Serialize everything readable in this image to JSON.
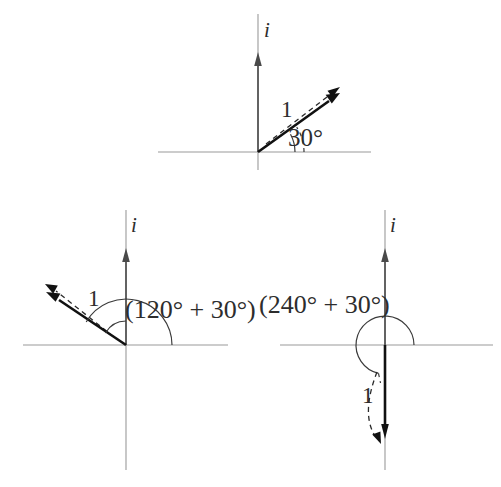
{
  "figure": {
    "background_color": "#ffffff",
    "axis_color": "#9a9a9a",
    "vector_color": "#111111",
    "label_color": "#2d2d2d",
    "panels": [
      {
        "id": "panel-top",
        "imaginary_axis_label": "i",
        "magnitude_label": "1",
        "angle_label": "30°",
        "angle_degrees": 30,
        "origin": [
          258,
          152
        ],
        "x_axis_span": [
          158,
          371
        ],
        "y_axis_span": [
          152,
          14
        ],
        "vector_tip": [
          334,
          98
        ],
        "dashed_arrow_tip": [
          338,
          92
        ]
      },
      {
        "id": "panel-bottom-left",
        "imaginary_axis_label": "i",
        "magnitude_label": "1",
        "angle_label": "(120° + 30°)",
        "angle_degrees": 150,
        "origin": [
          126,
          345
        ],
        "x_axis_span": [
          23,
          228
        ],
        "y_axis_span": [
          345,
          210
        ],
        "vector_tip": [
          48,
          296
        ],
        "dashed_arrow_tip": [
          44,
          291
        ]
      },
      {
        "id": "panel-bottom-right",
        "imaginary_axis_label": "i",
        "magnitude_label": "1",
        "angle_label": "(240° + 30°)",
        "angle_degrees": 270,
        "origin": [
          385,
          345
        ],
        "x_axis_span": [
          280,
          493
        ],
        "y_axis_span": [
          345,
          210
        ],
        "vector_tip": [
          385,
          437
        ],
        "dashed_arrow_tip": [
          382,
          441
        ]
      }
    ]
  }
}
